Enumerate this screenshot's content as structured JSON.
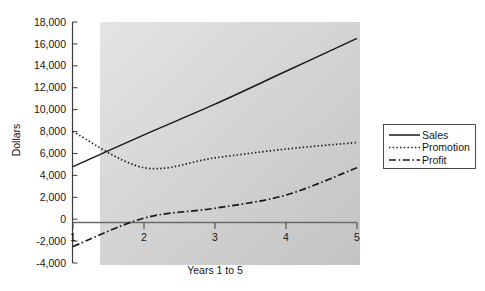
{
  "chart_data": {
    "type": "line",
    "title": "",
    "xlabel": "Years 1 to 5",
    "ylabel": "Dollars",
    "x": [
      1,
      2,
      3,
      4,
      5
    ],
    "xtick_labels": [
      "1",
      "2",
      "3",
      "4",
      "5"
    ],
    "ytick_labels": [
      "18,000",
      "16,000",
      "14,000",
      "12,000",
      "10,000",
      "8,000",
      "6,000",
      "4,000",
      "2,000",
      "0",
      "-2,000",
      "-4,000"
    ],
    "ytick_values": [
      18000,
      16000,
      14000,
      12000,
      10000,
      8000,
      6000,
      4000,
      2000,
      0,
      -2000,
      -4000
    ],
    "xlim": [
      1,
      5
    ],
    "ylim": [
      -4000,
      18000
    ],
    "grid": false,
    "legend_position": "right-outside",
    "plot_background": "#cdcdcd",
    "figure_background": "#ffffff",
    "series": [
      {
        "name": "Sales",
        "style": "solid",
        "color": "#1a1a1a",
        "values": [
          4800,
          7700,
          10500,
          13500,
          16500
        ]
      },
      {
        "name": "Promotion",
        "style": "dotted",
        "color": "#1a1a1a",
        "values": [
          8000,
          4700,
          5600,
          6400,
          7000
        ]
      },
      {
        "name": "Profit",
        "style": "dashdot",
        "color": "#1a1a1a",
        "values": [
          -2500,
          100,
          1000,
          2200,
          4700
        ]
      }
    ]
  },
  "legend": {
    "items": [
      {
        "label": "Sales",
        "style": "solid"
      },
      {
        "label": "Promotion",
        "style": "dotted"
      },
      {
        "label": "Profit",
        "style": "dashdot"
      }
    ]
  }
}
